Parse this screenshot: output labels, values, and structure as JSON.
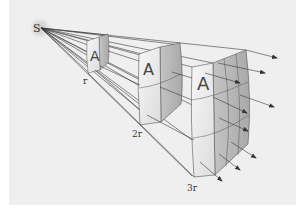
{
  "diagram": {
    "source": {
      "label": "S",
      "x": 40,
      "y": 28
    },
    "surfaces": [
      {
        "id": "surface-r",
        "distance_label": "r",
        "area_label": "A",
        "grid": "1x1"
      },
      {
        "id": "surface-2r",
        "distance_label": "2r",
        "area_label": "A",
        "grid": "2x2"
      },
      {
        "id": "surface-3r",
        "distance_label": "3r",
        "area_label": "A",
        "grid": "3x3"
      }
    ],
    "colors": {
      "background": "#efefef",
      "border_background": "#ffffff",
      "ray": "#3a3a3a",
      "surface_light": "#f4f4f4",
      "surface_shade": "#bdbdbd",
      "glow": "#d9d9d9"
    }
  }
}
